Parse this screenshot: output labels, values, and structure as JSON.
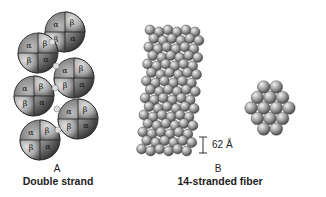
{
  "panel_a": {
    "letter": "A",
    "caption": "Double strand",
    "subunit_labels": [
      "α",
      "β"
    ],
    "molecule_count": 7
  },
  "panel_b": {
    "letter": "B",
    "caption": "14-stranded fiber",
    "scale_label": "62 Å",
    "cross_section_rows": [
      2,
      3,
      4,
      3,
      2
    ]
  }
}
